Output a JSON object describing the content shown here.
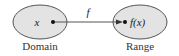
{
  "diagram": {
    "domain": {
      "label": "Domain",
      "element": "x"
    },
    "range": {
      "label": "Range",
      "element": "f(x)"
    },
    "mapping": {
      "label": "f"
    },
    "colors": {
      "ellipse_fill": "#e3e3e3",
      "ellipse_stroke": "#555555",
      "arrow": "#555555",
      "dot": "#111111"
    }
  }
}
